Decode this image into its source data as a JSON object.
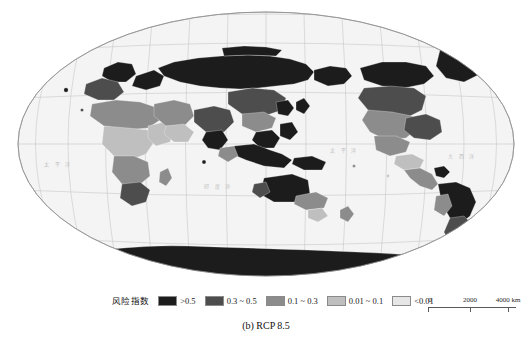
{
  "figure": {
    "caption": "(b) RCP 8.5"
  },
  "map": {
    "title": "",
    "projection_name": "world-map",
    "background_color": "#f4f4f4",
    "graticule_color": "#b9b9b9",
    "ocean_labels": [
      {
        "name": "pacific-ocean",
        "text": "太 平 洋",
        "x": 330,
        "y": 148
      },
      {
        "name": "atlantic-ocean",
        "text": "大 西 洋",
        "x": 446,
        "y": 152
      },
      {
        "name": "indian-ocean",
        "text": "印 度 洋",
        "x": 228,
        "y": 180
      },
      {
        "name": "pacific-ocean-west",
        "text": "太 平 洋",
        "x": 96,
        "y": 158
      }
    ],
    "longitude_labels": [
      "60°",
      "80°",
      "100°",
      "120°",
      "140°",
      "160°",
      "180°",
      "160°",
      "140°",
      "120°",
      "100°",
      "80°",
      "60°"
    ],
    "latitude_labels": [
      "60°",
      "30°",
      "0°",
      "30°",
      "60°"
    ]
  },
  "legend": {
    "title": "风险指数",
    "items": [
      {
        "name": "risk-very-high",
        "label": ">0.5",
        "color": "#1c1c1c"
      },
      {
        "name": "risk-high",
        "label": "0.3 ~ 0.5",
        "color": "#4d4d4d"
      },
      {
        "name": "risk-medium",
        "label": "0.1 ~ 0.3",
        "color": "#8c8c8c"
      },
      {
        "name": "risk-low",
        "label": "0.01 ~ 0.1",
        "color": "#bfbfbf"
      },
      {
        "name": "risk-very-low",
        "label": "<0.01",
        "color": "#e6e6e6"
      }
    ]
  },
  "scalebar": {
    "units": "km",
    "labels": [
      "0",
      "2000",
      "4000 km"
    ]
  }
}
